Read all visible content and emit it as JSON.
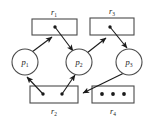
{
  "figure": {
    "type": "resource-allocation-graph",
    "width": 155,
    "height": 123,
    "background_color": "#ffffff",
    "line_color": "#4a4a4a",
    "edge_color": "#1a1a1a",
    "dot_color": "#1a1a1a"
  },
  "processes": [
    {
      "id": "p1",
      "label": "p",
      "subscript": "1",
      "cx": 25,
      "cy": 62,
      "r": 13
    },
    {
      "id": "p2",
      "label": "p",
      "subscript": "2",
      "cx": 79,
      "cy": 62,
      "r": 13
    },
    {
      "id": "p3",
      "label": "p",
      "subscript": "3",
      "cx": 129,
      "cy": 62,
      "r": 13
    }
  ],
  "resources": [
    {
      "id": "r1",
      "label": "r",
      "subscript": "1",
      "x": 32,
      "y": 19,
      "w": 45,
      "h": 16,
      "label_x": 54,
      "label_y": 15,
      "instances": 1,
      "dots": [
        {
          "cx": 55,
          "cy": 27
        }
      ]
    },
    {
      "id": "r3",
      "label": "r",
      "subscript": "3",
      "x": 90,
      "y": 18,
      "w": 44,
      "h": 17,
      "label_x": 112,
      "label_y": 14,
      "instances": 1,
      "dots": [
        {
          "cx": 110,
          "cy": 27
        }
      ]
    },
    {
      "id": "r2",
      "label": "r",
      "subscript": "2",
      "x": 30,
      "y": 86,
      "w": 48,
      "h": 17,
      "label_x": 54,
      "label_y": 114,
      "instances": 2,
      "dots": [
        {
          "cx": 43,
          "cy": 94
        },
        {
          "cx": 62,
          "cy": 94
        }
      ]
    },
    {
      "id": "r4",
      "label": "r",
      "subscript": "4",
      "x": 92,
      "y": 86,
      "w": 42,
      "h": 17,
      "label_x": 113,
      "label_y": 114,
      "instances": 3,
      "dots": [
        {
          "cx": 102,
          "cy": 94
        },
        {
          "cx": 113,
          "cy": 94
        },
        {
          "cx": 124,
          "cy": 94
        }
      ]
    }
  ],
  "edges": [
    {
      "id": "p1-to-r1",
      "kind": "request",
      "from": "p1",
      "to": "r1",
      "path": "M 32 52 L 52 37"
    },
    {
      "id": "r1-to-p2",
      "kind": "assignment",
      "from": "r1",
      "to": "p2",
      "path": "M 55 27 L 73 51"
    },
    {
      "id": "p2-to-r3",
      "kind": "request",
      "from": "p2",
      "to": "r3",
      "path": "M 87 53 L 106 38"
    },
    {
      "id": "r3-to-p3",
      "kind": "assignment",
      "from": "r3",
      "to": "p3",
      "path": "M 110 27 L 127 48"
    },
    {
      "id": "r2-to-p1",
      "kind": "assignment",
      "from": "r2",
      "to": "p1",
      "path": "M 43 94 L 27 76"
    },
    {
      "id": "r2-to-p2",
      "kind": "assignment",
      "from": "r2",
      "to": "p2",
      "path": "M 62 94 L 75 74"
    },
    {
      "id": "p3-to-r2",
      "kind": "request",
      "from": "p3",
      "to": "r2",
      "path": "M 124 73 L 82 93"
    }
  ]
}
